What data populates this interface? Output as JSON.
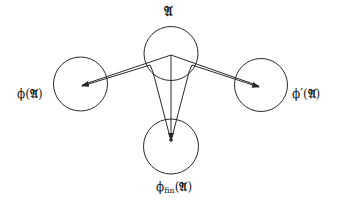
{
  "diagram": {
    "nodes": [
      {
        "id": "A",
        "label": "𝔄",
        "cx": 171,
        "cy": 53.5,
        "r": 27
      },
      {
        "id": "phiA",
        "label_prefix": "ϕ(",
        "label_frak": "𝔄",
        "label_suffix": ")",
        "cx": 80.5,
        "cy": 84,
        "r": 27
      },
      {
        "id": "phiPrimeA",
        "label_prefix": "ϕ′(",
        "label_frak": "𝔄",
        "label_suffix": ")",
        "cx": 261,
        "cy": 85,
        "r": 26.5
      },
      {
        "id": "phiFinA",
        "label_prefix": "ϕ",
        "label_sub": "fin",
        "label_open": "(",
        "label_frak": "𝔄",
        "label_suffix": ")",
        "cx": 171,
        "cy": 146.5,
        "r": 27.5
      }
    ],
    "edges": [
      {
        "from": "A",
        "to": "phiA"
      },
      {
        "from": "A",
        "to": "phiPrimeA"
      },
      {
        "from": "A",
        "to": "phiFinA"
      }
    ],
    "labels": {
      "top": "𝔄",
      "left_prefix": "ϕ(",
      "left_frak": "𝔄",
      "left_suffix": ")",
      "right_prefix": "ϕ′(",
      "right_frak": "𝔄",
      "right_suffix": ")",
      "bottom_prefix": "ϕ",
      "bottom_sub": "fin",
      "bottom_open": "(",
      "bottom_frak": "𝔄",
      "bottom_suffix": ")"
    },
    "stroke_color": "#2a2a2a"
  }
}
